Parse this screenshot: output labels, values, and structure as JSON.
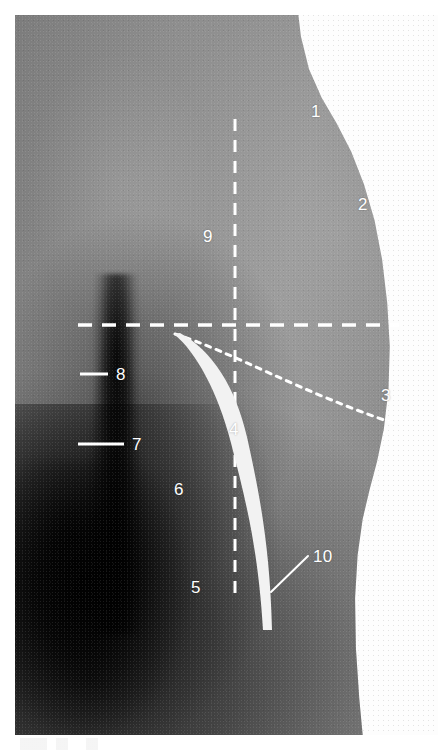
{
  "figure": {
    "kind": "anatomical-photograph",
    "plate": {
      "left": 15,
      "top": 15,
      "width": 423,
      "height": 720,
      "background_color": "#ffffff",
      "skin_midtone": "#8e8e8e",
      "shadow_color": "#000000"
    },
    "annotation_color": "#ffffff"
  },
  "labels": [
    {
      "id": "1",
      "text": "1",
      "x": 311,
      "y": 103,
      "marker": "none"
    },
    {
      "id": "2",
      "text": "2",
      "x": 358,
      "y": 196,
      "marker": "none"
    },
    {
      "id": "3",
      "text": "3",
      "x": 381,
      "y": 387,
      "marker": "none"
    },
    {
      "id": "4",
      "text": "4",
      "x": 229,
      "y": 421,
      "marker": "none"
    },
    {
      "id": "5",
      "text": "5",
      "x": 191,
      "y": 579,
      "marker": "none"
    },
    {
      "id": "6",
      "text": "6",
      "x": 174,
      "y": 481,
      "marker": "none"
    },
    {
      "id": "7",
      "text": "7",
      "x": 132,
      "y": 436,
      "marker": "tick"
    },
    {
      "id": "8",
      "text": "8",
      "x": 116,
      "y": 366,
      "marker": "tick"
    },
    {
      "id": "9",
      "text": "9",
      "x": 203,
      "y": 228,
      "marker": "none"
    },
    {
      "id": "10",
      "text": "10",
      "x": 313,
      "y": 548,
      "marker": "leader"
    }
  ],
  "overlay": {
    "vertical_dashed_line": {
      "name": "vertical-reference-line",
      "style": "dashed",
      "color": "#ffffff",
      "width": 3,
      "dash": "12,9",
      "x": 235,
      "y_start": 119,
      "y_end": 597
    },
    "horizontal_dashed_line": {
      "name": "horizontal-reference-line",
      "style": "dashed",
      "color": "#ffffff",
      "width": 3.5,
      "dash": "14,10",
      "y": 325,
      "x_start": 78,
      "x_end": 399
    },
    "dotted_oblique_line": {
      "name": "oblique-dotted-line",
      "style": "dotted",
      "color": "#ffffff",
      "width": 3,
      "dash": "5,6",
      "path": "M 175 334 C 232 352, 300 392, 396 424"
    },
    "thick_curve": {
      "name": "thick-curved-marker",
      "style": "solid-tapered",
      "color": "#f4f4f4",
      "start": {
        "x": 174,
        "y": 334
      },
      "end": {
        "x": 267,
        "y": 630
      },
      "max_width": 10,
      "min_width": 2
    },
    "leader_line_10": {
      "name": "leader-line-10",
      "color": "#ffffff",
      "width": 2,
      "from": {
        "x": 271,
        "y": 592
      },
      "to": {
        "x": 308,
        "y": 556
      }
    },
    "tick_8": {
      "name": "tick-mark-8",
      "color": "#ffffff",
      "width": 3,
      "y": 374,
      "x_start": 80,
      "x_end": 108
    },
    "tick_7": {
      "name": "tick-mark-7",
      "color": "#ffffff",
      "width": 3,
      "y": 444,
      "x_start": 78,
      "x_end": 124
    }
  }
}
